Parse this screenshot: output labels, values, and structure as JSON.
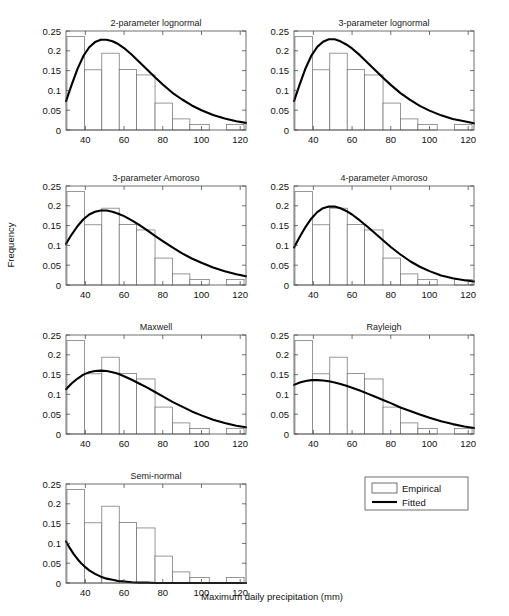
{
  "figure": {
    "xlabel": "Maximum daily precipitation (mm)",
    "ylabel": "Frequency"
  },
  "legend": {
    "empirical_label": "Empirical",
    "fitted_label": "Fitted"
  },
  "axis": {
    "xticks": [
      "40",
      "60",
      "80",
      "100",
      "120"
    ],
    "yticks": [
      "0",
      "0.05",
      "0.1",
      "0.15",
      "0.2",
      "0.25"
    ]
  },
  "chart_data": {
    "type": "bar",
    "title": "",
    "xlabel": "Maximum daily precipitation (mm)",
    "ylabel": "Frequency",
    "xlim": [
      30,
      123
    ],
    "ylim": [
      0,
      0.25
    ],
    "grid": false,
    "legend_position": "below-right",
    "legend_entries": [
      "Empirical",
      "Fitted"
    ],
    "xticks": [
      40,
      60,
      80,
      100,
      120
    ],
    "yticks": [
      0,
      0.05,
      0.1,
      0.15,
      0.2,
      0.25
    ],
    "empirical_histogram": {
      "bin_edges": [
        30.5,
        39.5,
        48.5,
        57.5,
        66.5,
        76.0,
        85.0,
        94.0,
        104.0,
        113.0,
        122.0
      ],
      "values": [
        0.236,
        0.152,
        0.194,
        0.153,
        0.139,
        0.068,
        0.028,
        0.014,
        0.0,
        0.014
      ]
    },
    "panels": [
      {
        "title": "2-parameter lognormal",
        "row": 1,
        "col": 1,
        "fitted_curve": {
          "x": [
            30,
            33,
            36,
            39,
            42,
            45,
            48,
            51,
            54,
            57,
            60,
            64,
            68,
            72,
            76,
            80,
            85,
            90,
            95,
            100,
            106,
            112,
            118,
            123
          ],
          "y": [
            0.073,
            0.115,
            0.155,
            0.187,
            0.209,
            0.222,
            0.228,
            0.228,
            0.224,
            0.217,
            0.207,
            0.19,
            0.171,
            0.152,
            0.133,
            0.115,
            0.094,
            0.077,
            0.062,
            0.05,
            0.038,
            0.029,
            0.022,
            0.018
          ]
        }
      },
      {
        "title": "3-parameter lognormal",
        "row": 1,
        "col": 2,
        "fitted_curve": {
          "x": [
            30,
            33,
            36,
            39,
            42,
            45,
            48,
            51,
            54,
            57,
            60,
            64,
            68,
            72,
            76,
            80,
            85,
            90,
            95,
            100,
            106,
            112,
            118,
            123
          ],
          "y": [
            0.073,
            0.116,
            0.156,
            0.188,
            0.21,
            0.223,
            0.229,
            0.229,
            0.224,
            0.216,
            0.206,
            0.189,
            0.17,
            0.151,
            0.132,
            0.114,
            0.093,
            0.076,
            0.061,
            0.049,
            0.037,
            0.028,
            0.022,
            0.017
          ]
        }
      },
      {
        "title": "3-parameter Amoroso",
        "row": 2,
        "col": 1,
        "fitted_curve": {
          "x": [
            30,
            33,
            36,
            39,
            42,
            45,
            48,
            51,
            54,
            57,
            60,
            64,
            68,
            72,
            76,
            80,
            85,
            90,
            95,
            100,
            106,
            112,
            118,
            123
          ],
          "y": [
            0.104,
            0.128,
            0.149,
            0.166,
            0.178,
            0.185,
            0.188,
            0.188,
            0.185,
            0.18,
            0.174,
            0.163,
            0.151,
            0.138,
            0.124,
            0.111,
            0.095,
            0.08,
            0.067,
            0.056,
            0.044,
            0.035,
            0.027,
            0.022
          ]
        }
      },
      {
        "title": "4-parameter Amoroso",
        "row": 2,
        "col": 2,
        "fitted_curve": {
          "x": [
            30,
            33,
            36,
            39,
            42,
            45,
            48,
            51,
            54,
            57,
            60,
            64,
            68,
            72,
            76,
            80,
            85,
            90,
            95,
            100,
            106,
            112,
            118,
            123
          ],
          "y": [
            0.095,
            0.122,
            0.147,
            0.168,
            0.184,
            0.194,
            0.198,
            0.198,
            0.194,
            0.187,
            0.178,
            0.163,
            0.147,
            0.13,
            0.113,
            0.096,
            0.077,
            0.06,
            0.046,
            0.035,
            0.024,
            0.017,
            0.012,
            0.009
          ]
        }
      },
      {
        "title": "Maxwell",
        "row": 3,
        "col": 1,
        "fitted_curve": {
          "x": [
            30,
            33,
            36,
            39,
            42,
            45,
            48,
            51,
            54,
            57,
            60,
            64,
            68,
            72,
            76,
            80,
            85,
            90,
            95,
            100,
            106,
            112,
            118,
            123
          ],
          "y": [
            0.113,
            0.128,
            0.14,
            0.15,
            0.156,
            0.159,
            0.16,
            0.159,
            0.156,
            0.152,
            0.146,
            0.137,
            0.127,
            0.117,
            0.106,
            0.095,
            0.081,
            0.069,
            0.057,
            0.047,
            0.036,
            0.028,
            0.021,
            0.017
          ]
        }
      },
      {
        "title": "Rayleigh",
        "row": 3,
        "col": 2,
        "fitted_curve": {
          "x": [
            30,
            33,
            36,
            39,
            42,
            45,
            48,
            51,
            54,
            57,
            60,
            64,
            68,
            72,
            76,
            80,
            85,
            90,
            95,
            100,
            106,
            112,
            118,
            123
          ],
          "y": [
            0.124,
            0.13,
            0.134,
            0.136,
            0.136,
            0.135,
            0.133,
            0.13,
            0.126,
            0.122,
            0.117,
            0.11,
            0.102,
            0.094,
            0.086,
            0.078,
            0.067,
            0.058,
            0.049,
            0.041,
            0.032,
            0.025,
            0.019,
            0.015
          ]
        }
      },
      {
        "title": "Semi-normal",
        "row": 4,
        "col": 1,
        "fitted_curve": {
          "x": [
            30,
            32,
            34,
            36,
            38,
            40,
            42,
            45,
            48,
            51,
            54,
            57,
            60,
            64,
            68,
            72,
            76,
            80,
            85,
            90,
            95,
            100,
            106,
            112,
            118,
            123
          ],
          "y": [
            0.105,
            0.088,
            0.073,
            0.06,
            0.049,
            0.04,
            0.032,
            0.023,
            0.016,
            0.011,
            0.008,
            0.005,
            0.004,
            0.002,
            0.001,
            0.001,
            0.0,
            0.0,
            0.0,
            0.0,
            0.0,
            0.0,
            0.0,
            0.0,
            0.0,
            0.0
          ]
        }
      }
    ]
  }
}
